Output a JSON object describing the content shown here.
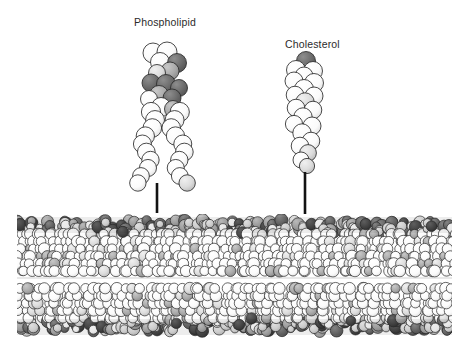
{
  "figure": {
    "background_color": "#ffffff",
    "width": 466,
    "height": 354
  },
  "labels": {
    "phospholipid": "Phospholipid",
    "cholesterol": "Cholesterol"
  },
  "callouts": [
    {
      "name": "phospholipid-leader-line",
      "x": 157,
      "y_top": 183,
      "y_bottom": 213,
      "color": "#121212",
      "width": 2.6
    },
    {
      "name": "cholesterol-leader-line",
      "x": 305,
      "y_top": 172,
      "y_bottom": 214,
      "color": "#121212",
      "width": 2.6
    }
  ],
  "colors": {
    "atom_white": "#fdfdfd",
    "atom_light_gray": "#d8d8d8",
    "atom_mid_gray": "#a8a8a8",
    "atom_dark_gray": "#6c6c6c",
    "atom_darkest_gray": "#4a4a4a",
    "outline": "#2a2a2a",
    "text": "#2b2b2b",
    "leader_line": "#121212"
  },
  "molecules": {
    "phospholipid": {
      "label": "Phospholipid",
      "center_x": 163,
      "head_top_y": 46,
      "tails_bottom_y": 180,
      "head_group_color": "#6c6c6c",
      "tail_color": "#fdfdfd",
      "tail_count": 2
    },
    "cholesterol": {
      "label": "Cholesterol",
      "center_x": 305,
      "head_top_y": 55,
      "bottom_y": 172,
      "hydroxyl_color": "#6c6c6c",
      "ring_color": "#fdfdfd"
    }
  },
  "membrane": {
    "name": "phospholipid-bilayer",
    "left": 17,
    "right": 452,
    "top": 214,
    "bottom": 338,
    "midline_y": 278,
    "leaflets": [
      {
        "name": "outer-leaflet",
        "top": 214,
        "bottom": 278,
        "head_band_height": 18
      },
      {
        "name": "inner-leaflet",
        "top": 278,
        "bottom": 338,
        "head_band_height": 18
      }
    ],
    "lipid_columns": 34
  }
}
